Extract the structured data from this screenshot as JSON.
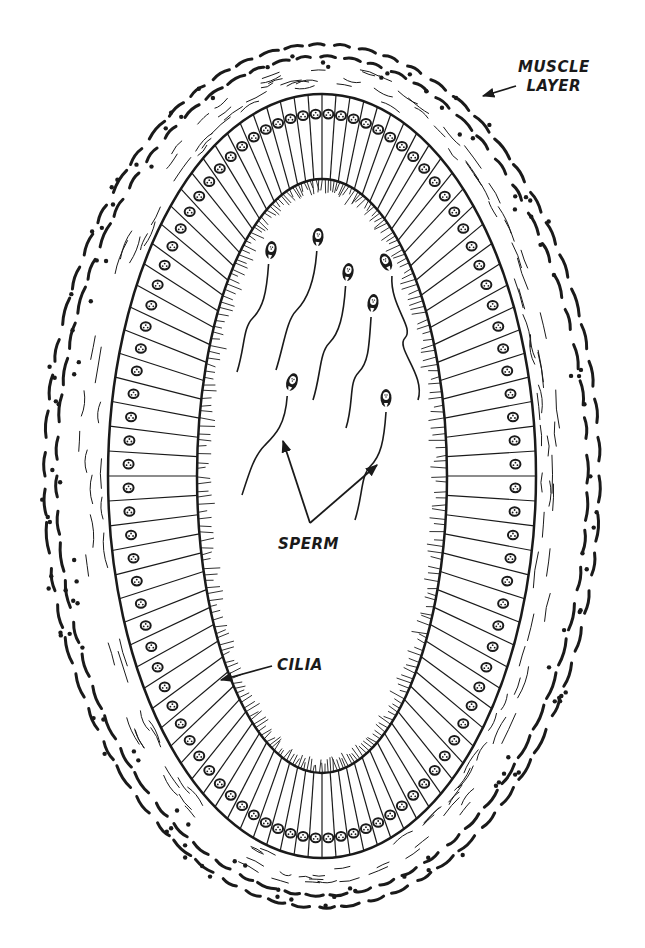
{
  "diagram": {
    "colors": {
      "ink": "#1a1a1a",
      "background": "#ffffff"
    },
    "geometry": {
      "center": [
        322,
        476
      ],
      "muscle_outer": {
        "rx": 283,
        "ry": 437
      },
      "muscle_inner": {
        "rx": 232,
        "ry": 400
      },
      "epithelium_outer": {
        "rx": 214,
        "ry": 382
      },
      "lumen": {
        "rx": 125,
        "ry": 297
      },
      "cell_count": 96
    },
    "sperm": [
      {
        "head": [
          271,
          250
        ],
        "angle": 10,
        "tail_to": [
          237,
          372
        ]
      },
      {
        "head": [
          318,
          237
        ],
        "angle": 5,
        "tail_to": [
          276,
          370
        ]
      },
      {
        "head": [
          348,
          272
        ],
        "angle": 10,
        "tail_to": [
          313,
          400
        ]
      },
      {
        "head": [
          386,
          262
        ],
        "angle": -25,
        "tail_to": [
          418,
          400
        ]
      },
      {
        "head": [
          373,
          303
        ],
        "angle": 8,
        "tail_to": [
          346,
          428
        ]
      },
      {
        "head": [
          292,
          382
        ],
        "angle": 20,
        "tail_to": [
          242,
          495
        ]
      },
      {
        "head": [
          386,
          398
        ],
        "angle": 0,
        "tail_to": [
          355,
          520
        ]
      }
    ]
  },
  "labels": {
    "muscle_layer": {
      "line1": "MUSCLE",
      "line2": "LAYER"
    },
    "sperm": "SPERM",
    "cilia": "CILIA"
  },
  "arrows": {
    "muscle_layer": {
      "from": [
        516,
        86
      ],
      "to": [
        483,
        96
      ]
    },
    "sperm_left": {
      "from": [
        310,
        523
      ],
      "to": [
        283,
        441
      ]
    },
    "sperm_right": {
      "from": [
        310,
        523
      ],
      "to": [
        377,
        465
      ]
    },
    "cilia": {
      "from": [
        272,
        666
      ],
      "to": [
        221,
        680
      ]
    }
  }
}
